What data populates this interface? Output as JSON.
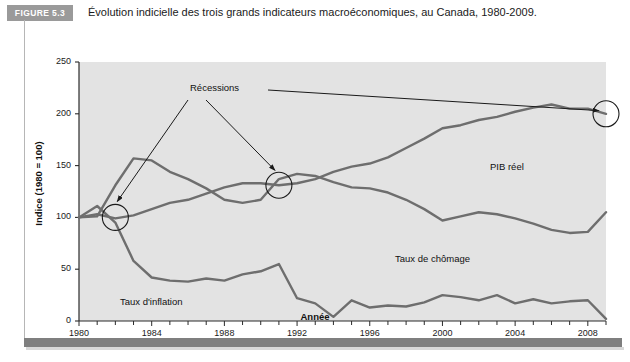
{
  "figure": {
    "badge": "FIGURE 5.3",
    "caption": "Évolution indicielle des trois grands indicateurs macroéconomiques, au Canada, 1980-2009."
  },
  "colors": {
    "badge_bg": "#9a9a9a",
    "plot_bg": "#e3e3e3",
    "series_line": "#6e6e6e",
    "axis": "#2a2a2a",
    "annotation": "#1a1a1a",
    "frame_bar": "#7f7f7f"
  },
  "chart_data": {
    "type": "line",
    "title": "Évolution indicielle des trois grands indicateurs macroéconomiques, au Canada, 1980-2009.",
    "xlabel": "Année",
    "ylabel": "Indice (1980 = 100)",
    "xlim": [
      1980,
      2009
    ],
    "ylim": [
      0,
      250
    ],
    "grid": false,
    "legend_position": "inline-labels",
    "xticks": [
      1980,
      1984,
      1988,
      1992,
      1996,
      2000,
      2004,
      2008
    ],
    "xtick_labels": [
      "1980",
      "1984",
      "1988",
      "1992",
      "1996",
      "2000",
      "2004",
      "2008"
    ],
    "xminor_step": 1,
    "yticks": [
      0,
      50,
      100,
      150,
      200,
      250
    ],
    "ytick_labels": [
      "0",
      "50",
      "100",
      "150",
      "200",
      "250"
    ],
    "x": [
      1980,
      1981,
      1982,
      1983,
      1984,
      1985,
      1986,
      1987,
      1988,
      1989,
      1990,
      1991,
      1992,
      1993,
      1994,
      1995,
      1996,
      1997,
      1998,
      1999,
      2000,
      2001,
      2002,
      2003,
      2004,
      2005,
      2006,
      2007,
      2008,
      2009
    ],
    "series": [
      {
        "name": "PIB réel",
        "label": "PIB réel",
        "values": [
          100,
          103,
          99,
          102,
          108,
          114,
          117,
          123,
          129,
          133,
          133,
          131,
          133,
          137,
          144,
          149,
          152,
          158,
          167,
          176,
          186,
          189,
          194,
          197,
          202,
          206,
          209,
          205,
          205,
          200
        ]
      },
      {
        "name": "Taux de chômage",
        "label": "Taux de chômage",
        "values": [
          100,
          101,
          131,
          157,
          155,
          144,
          137,
          128,
          117,
          114,
          117,
          137,
          142,
          140,
          134,
          129,
          128,
          124,
          117,
          108,
          97,
          101,
          105,
          103,
          99,
          94,
          88,
          85,
          86,
          105
        ]
      },
      {
        "name": "Taux d'inflation",
        "label": "Taux d'inflation",
        "values": [
          100,
          111,
          95,
          58,
          42,
          39,
          38,
          41,
          39,
          45,
          48,
          55,
          22,
          17,
          4,
          20,
          13,
          15,
          14,
          18,
          25,
          23,
          20,
          25,
          17,
          21,
          17,
          19,
          20,
          2
        ]
      }
    ],
    "annotations": [
      {
        "name": "Récessions",
        "text": "Récessions",
        "marked_points": [
          {
            "year": 1982,
            "index_value": 100
          },
          {
            "year": 1991,
            "index_value": 131
          },
          {
            "year": 2009,
            "index_value": 200
          }
        ]
      }
    ]
  }
}
